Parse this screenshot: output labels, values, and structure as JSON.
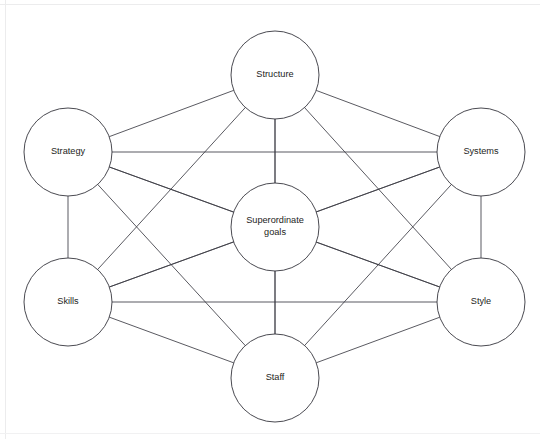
{
  "diagram": {
    "type": "node-link-diagram",
    "canvas": {
      "width": 540,
      "height": 439,
      "background": "#ffffff"
    },
    "style": {
      "node_fill": "#ffffff",
      "node_stroke": "#35353d",
      "edge_stroke": "#3c3c44",
      "label_color": "#1d1d22",
      "frame_color": "#ececed"
    },
    "frame": {
      "top_label": "frame-top-rule",
      "left_label": "frame-left-rule",
      "bottom_label": "frame-bottom-rule"
    },
    "nodes": [
      {
        "id": "structure",
        "label": "Structure",
        "label_lines": [
          "Structure"
        ],
        "cx": 275,
        "cy": 75,
        "r": 44
      },
      {
        "id": "strategy",
        "label": "Strategy",
        "label_lines": [
          "Strategy"
        ],
        "cx": 68,
        "cy": 152,
        "r": 44
      },
      {
        "id": "systems",
        "label": "Systems",
        "label_lines": [
          "Systems"
        ],
        "cx": 481,
        "cy": 152,
        "r": 44
      },
      {
        "id": "superordinate",
        "label": "Superordinate goals",
        "label_lines": [
          "Superordinate",
          "goals"
        ],
        "cx": 275,
        "cy": 227,
        "r": 44
      },
      {
        "id": "skills",
        "label": "Skills",
        "label_lines": [
          "Skills"
        ],
        "cx": 68,
        "cy": 302,
        "r": 44
      },
      {
        "id": "style",
        "label": "Style",
        "label_lines": [
          "Style"
        ],
        "cx": 481,
        "cy": 302,
        "r": 44
      },
      {
        "id": "staff",
        "label": "Staff",
        "label_lines": [
          "Staff"
        ],
        "cx": 275,
        "cy": 378,
        "r": 44
      }
    ],
    "edges": [
      {
        "from": "structure",
        "to": "strategy"
      },
      {
        "from": "structure",
        "to": "systems"
      },
      {
        "from": "structure",
        "to": "superordinate"
      },
      {
        "from": "structure",
        "to": "skills"
      },
      {
        "from": "structure",
        "to": "style"
      },
      {
        "from": "structure",
        "to": "staff"
      },
      {
        "from": "strategy",
        "to": "systems"
      },
      {
        "from": "strategy",
        "to": "superordinate"
      },
      {
        "from": "strategy",
        "to": "skills"
      },
      {
        "from": "strategy",
        "to": "style"
      },
      {
        "from": "strategy",
        "to": "staff"
      },
      {
        "from": "systems",
        "to": "superordinate"
      },
      {
        "from": "systems",
        "to": "skills"
      },
      {
        "from": "systems",
        "to": "style"
      },
      {
        "from": "systems",
        "to": "staff"
      },
      {
        "from": "superordinate",
        "to": "skills"
      },
      {
        "from": "superordinate",
        "to": "style"
      },
      {
        "from": "superordinate",
        "to": "staff"
      },
      {
        "from": "skills",
        "to": "style"
      },
      {
        "from": "skills",
        "to": "staff"
      },
      {
        "from": "style",
        "to": "staff"
      }
    ]
  }
}
